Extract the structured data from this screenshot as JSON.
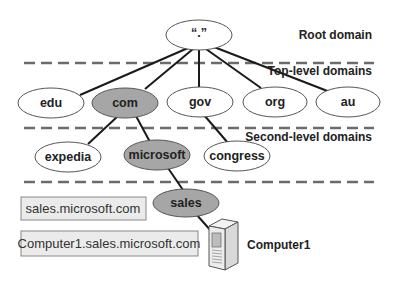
{
  "diagram": {
    "levels": [
      {
        "label": "Root domain"
      },
      {
        "label": "Top-level domains"
      },
      {
        "label": "Second-level domains"
      }
    ],
    "nodes": {
      "root": {
        "label": "“.”",
        "highlighted": false
      },
      "edu": {
        "label": "edu",
        "highlighted": false
      },
      "com": {
        "label": "com",
        "highlighted": true
      },
      "gov": {
        "label": "gov",
        "highlighted": false
      },
      "org": {
        "label": "org",
        "highlighted": false
      },
      "au": {
        "label": "au",
        "highlighted": false
      },
      "expedia": {
        "label": "expedia",
        "highlighted": false
      },
      "microsoft": {
        "label": "microsoft",
        "highlighted": true
      },
      "congress": {
        "label": "congress",
        "highlighted": false
      },
      "sales": {
        "label": "sales",
        "highlighted": true
      }
    },
    "fqdn_boxes": [
      {
        "label": "sales.microsoft.com"
      },
      {
        "label": "Computer1.sales.microsoft.com"
      }
    ],
    "host": {
      "label": "Computer1",
      "icon": "server-icon"
    },
    "colors": {
      "highlight_fill": "#a6a6a6",
      "node_fill": "#ffffff",
      "box_fill": "#ebebeb",
      "dash": "#6b6b6b",
      "line": "#1a1a1a"
    }
  }
}
